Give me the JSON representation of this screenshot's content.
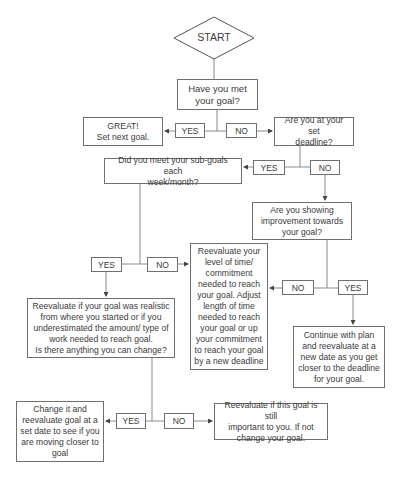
{
  "flowchart": {
    "start": "START",
    "q_met_goal": "Have you met\nyour goal?",
    "great": "GREAT!\nSet next goal.",
    "q_deadline": "Are you at your set\ndeadline?",
    "q_subgoals": "Did you meet your sub-goals each\nweek/month?",
    "q_improvement": "Are you showing\nimprovement towards\nyour goal?",
    "reevaluate_time": "Reevaluate your\nlevel of time/\ncommitment\nneeded to reach\nyour goal. Adjust\nlength of time\nneeded to reach\nyour goal or up\nyour commitment\nto reach your goal\nby a new deadline",
    "reevaluate_realistic": "Reevaluate if your goal was realistic\nfrom where you started or if you\nunderestimated the amount/ type of\nwork needed to reach goal.\nIs there anything you can change?",
    "continue_plan": "Continue with plan\nand reevaluate at a\nnew date as you get\ncloser to the deadline\nfor your goal.",
    "change_it": "Change it and\nreevaluate goal at a\nset date to see if you\nare moving closer to\ngoal",
    "still_important": "Reevaluate if this goal is still\nimportant to you. If not\nchange your goal.",
    "labels": {
      "yes": "YES",
      "no": "NO"
    }
  }
}
